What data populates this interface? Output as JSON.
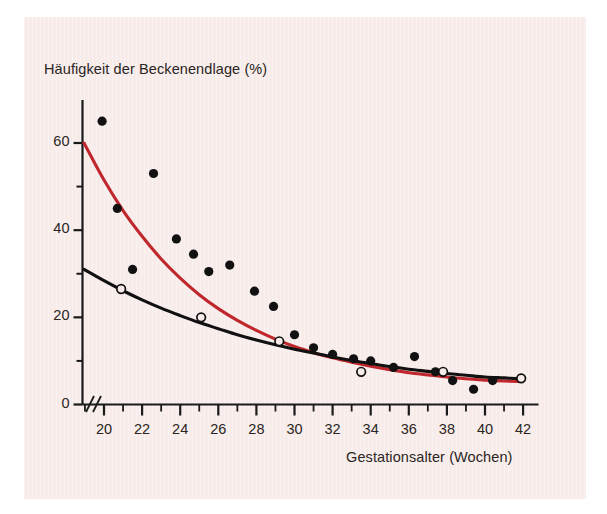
{
  "figure": {
    "background_color": "#ffffff",
    "panel_color": "#f7ecea",
    "axis_color": "#1a1a1a"
  },
  "chart_data": {
    "type": "scatter",
    "title": "",
    "ylabel": "Häufigkeit der Beckenendlage (%)",
    "xlabel": "Gestationsalter (Wochen)",
    "xlim": [
      18.6,
      42.6
    ],
    "ylim": [
      0,
      70
    ],
    "xticks": [
      20,
      22,
      24,
      26,
      28,
      30,
      32,
      34,
      36,
      38,
      40,
      42
    ],
    "xtick_labels": [
      "20",
      "22",
      "24",
      "26",
      "28",
      "30",
      "32",
      "34",
      "36",
      "38",
      "40",
      "42"
    ],
    "xtick_minor_step": 1,
    "yticks": [
      0,
      20,
      40,
      60
    ],
    "ytick_labels": [
      "0",
      "20",
      "40",
      "60"
    ],
    "ytick_minor": [
      10,
      30,
      50
    ],
    "grid": false,
    "axis_break": "//",
    "legend_position": "none",
    "series": [
      {
        "name": "filled-points",
        "type": "scatter",
        "marker": "filled-circle",
        "color": "#111111",
        "points": [
          [
            19.9,
            65.0
          ],
          [
            20.7,
            45.0
          ],
          [
            21.5,
            31.0
          ],
          [
            22.6,
            53.0
          ],
          [
            23.8,
            38.0
          ],
          [
            24.7,
            34.5
          ],
          [
            25.5,
            30.5
          ],
          [
            26.6,
            32.0
          ],
          [
            27.9,
            26.0
          ],
          [
            28.9,
            22.5
          ],
          [
            30.0,
            16.0
          ],
          [
            31.0,
            13.0
          ],
          [
            32.0,
            11.5
          ],
          [
            33.1,
            10.5
          ],
          [
            34.0,
            10.0
          ],
          [
            35.2,
            8.5
          ],
          [
            36.3,
            11.0
          ],
          [
            37.4,
            7.5
          ],
          [
            38.3,
            5.5
          ],
          [
            39.4,
            3.5
          ],
          [
            40.4,
            5.5
          ],
          [
            41.9,
            6.0
          ]
        ]
      },
      {
        "name": "open-points",
        "type": "scatter",
        "marker": "open-circle",
        "color": "#111111",
        "points": [
          [
            20.9,
            26.5
          ],
          [
            25.1,
            20.0
          ],
          [
            29.2,
            14.5
          ],
          [
            33.5,
            7.5
          ],
          [
            37.8,
            7.5
          ],
          [
            41.9,
            6.0
          ]
        ]
      },
      {
        "name": "red-fit-curve",
        "type": "line",
        "color": "#c0272d",
        "points": [
          [
            18.95,
            60.0
          ],
          [
            20.0,
            51.5
          ],
          [
            21.0,
            44.5
          ],
          [
            22.0,
            38.6
          ],
          [
            23.0,
            33.4
          ],
          [
            24.0,
            29.0
          ],
          [
            25.0,
            25.2
          ],
          [
            26.0,
            22.0
          ],
          [
            27.0,
            19.3
          ],
          [
            28.0,
            17.0
          ],
          [
            29.0,
            15.0
          ],
          [
            30.0,
            13.3
          ],
          [
            31.0,
            11.9
          ],
          [
            32.0,
            10.7
          ],
          [
            33.0,
            9.7
          ],
          [
            34.0,
            8.8
          ],
          [
            35.0,
            8.0
          ],
          [
            36.0,
            7.3
          ],
          [
            37.0,
            6.8
          ],
          [
            38.0,
            6.3
          ],
          [
            39.0,
            5.9
          ],
          [
            40.0,
            5.6
          ],
          [
            41.0,
            5.4
          ],
          [
            41.9,
            5.3
          ]
        ]
      },
      {
        "name": "black-fit-curve",
        "type": "line",
        "color": "#111111",
        "points": [
          [
            18.95,
            31.0
          ],
          [
            20.0,
            28.4
          ],
          [
            21.0,
            26.1
          ],
          [
            22.0,
            24.0
          ],
          [
            23.0,
            22.1
          ],
          [
            24.0,
            20.4
          ],
          [
            25.0,
            18.8
          ],
          [
            26.0,
            17.4
          ],
          [
            27.0,
            16.0
          ],
          [
            28.0,
            14.8
          ],
          [
            29.0,
            13.7
          ],
          [
            30.0,
            12.7
          ],
          [
            31.0,
            11.8
          ],
          [
            32.0,
            10.9
          ],
          [
            33.0,
            10.1
          ],
          [
            34.0,
            9.4
          ],
          [
            35.0,
            8.7
          ],
          [
            36.0,
            8.1
          ],
          [
            37.0,
            7.6
          ],
          [
            38.0,
            7.1
          ],
          [
            39.0,
            6.7
          ],
          [
            40.0,
            6.3
          ],
          [
            41.0,
            6.1
          ],
          [
            41.9,
            5.9
          ]
        ]
      }
    ]
  }
}
